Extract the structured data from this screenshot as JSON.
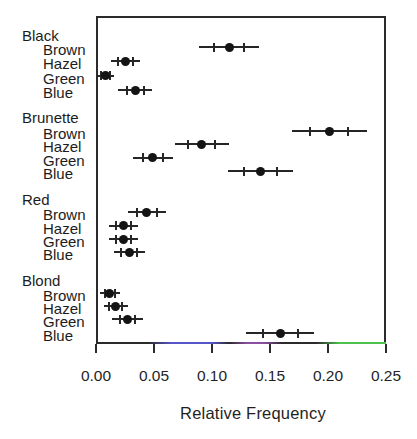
{
  "colors": {
    "ink": "#2b2b2b",
    "dot": "#141414",
    "axis_tint_blue": "#5656c8",
    "axis_tint_purple": "#8a4f9e",
    "axis_tint_green": "#4cc24c",
    "background": "#ffffff"
  },
  "chart_data": {
    "type": "scatter",
    "subtype": "dot-plot-with-error-bars",
    "title": "",
    "xlabel": "Relative Frequency",
    "ylabel": "",
    "xlim": [
      0,
      0.25
    ],
    "grid": false,
    "legend": false,
    "x_tick_values": [
      0,
      0.05,
      0.1,
      0.15,
      0.2,
      0.25
    ],
    "x_tick_labels": [
      "0.00",
      "0.05",
      "0.10",
      "0.15",
      "0.20",
      "0.25"
    ],
    "groups": [
      {
        "label": "Black",
        "items": [
          {
            "label": "Brown",
            "value": 0.1149,
            "inner": [
              0.1018,
              0.128
            ],
            "outer": [
              0.0892,
              0.1406
            ]
          },
          {
            "label": "Hazel",
            "value": 0.0253,
            "inner": [
              0.0189,
              0.0318
            ],
            "outer": [
              0.0127,
              0.038
            ]
          },
          {
            "label": "Green",
            "value": 0.0084,
            "inner": [
              0.0047,
              0.0122
            ],
            "outer": [
              0.0011,
              0.0158
            ]
          },
          {
            "label": "Blue",
            "value": 0.0338,
            "inner": [
              0.0264,
              0.0412
            ],
            "outer": [
              0.0192,
              0.0484
            ]
          }
        ]
      },
      {
        "label": "Brunette",
        "items": [
          {
            "label": "Brown",
            "value": 0.201,
            "inner": [
              0.1845,
              0.2175
            ],
            "outer": [
              0.1687,
              0.2333
            ]
          },
          {
            "label": "Hazel",
            "value": 0.0912,
            "inner": [
              0.0794,
              0.103
            ],
            "outer": [
              0.068,
              0.1144
            ]
          },
          {
            "label": "Green",
            "value": 0.049,
            "inner": [
              0.0401,
              0.0579
            ],
            "outer": [
              0.0316,
              0.0664
            ]
          },
          {
            "label": "Blue",
            "value": 0.1419,
            "inner": [
              0.1276,
              0.1562
            ],
            "outer": [
              0.1138,
              0.17
            ]
          }
        ]
      },
      {
        "label": "Red",
        "items": [
          {
            "label": "Brown",
            "value": 0.0439,
            "inner": [
              0.0355,
              0.0523
            ],
            "outer": [
              0.0274,
              0.0604
            ]
          },
          {
            "label": "Hazel",
            "value": 0.0236,
            "inner": [
              0.0174,
              0.0299
            ],
            "outer": [
              0.0114,
              0.0359
            ]
          },
          {
            "label": "Green",
            "value": 0.0236,
            "inner": [
              0.0174,
              0.0299
            ],
            "outer": [
              0.0114,
              0.0359
            ]
          },
          {
            "label": "Blue",
            "value": 0.0287,
            "inner": [
              0.0219,
              0.0356
            ],
            "outer": [
              0.0153,
              0.0422
            ]
          }
        ]
      },
      {
        "label": "Blond",
        "items": [
          {
            "label": "Brown",
            "value": 0.0118,
            "inner": [
              0.0074,
              0.0163
            ],
            "outer": [
              0.0031,
              0.0205
            ]
          },
          {
            "label": "Hazel",
            "value": 0.0169,
            "inner": [
              0.0116,
              0.0222
            ],
            "outer": [
              0.0065,
              0.0273
            ]
          },
          {
            "label": "Green",
            "value": 0.027,
            "inner": [
              0.0204,
              0.0337
            ],
            "outer": [
              0.014,
              0.0401
            ]
          },
          {
            "label": "Blue",
            "value": 0.1588,
            "inner": [
              0.1438,
              0.1738
            ],
            "outer": [
              0.1293,
              0.1882
            ]
          }
        ]
      }
    ]
  }
}
